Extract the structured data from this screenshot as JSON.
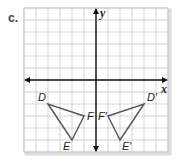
{
  "part_label": "c.",
  "axes": {
    "x_label": "x",
    "y_label": "y",
    "x_range": [
      -6,
      6
    ],
    "y_range": [
      -6,
      6
    ]
  },
  "grid": {
    "on": true,
    "step": 1
  },
  "colors": {
    "grid": "#c8c8c8",
    "axis": "#111111",
    "triangle": "#555555",
    "border_shadow": "#dddddd"
  },
  "shapes": [
    {
      "name": "DEF",
      "vertices": [
        {
          "label": "D",
          "x": -4,
          "y": -2,
          "label_pos": "upper-left"
        },
        {
          "label": "E",
          "x": -2,
          "y": -5,
          "label_pos": "lower-left"
        },
        {
          "label": "F",
          "x": -1,
          "y": -3,
          "label_pos": "right"
        }
      ]
    },
    {
      "name": "D'E'F'",
      "vertices": [
        {
          "label": "D′",
          "x": 4,
          "y": -2,
          "label_pos": "upper-right"
        },
        {
          "label": "E′",
          "x": 2,
          "y": -5,
          "label_pos": "lower-right"
        },
        {
          "label": "F′",
          "x": 1,
          "y": -3,
          "label_pos": "left"
        }
      ]
    }
  ]
}
